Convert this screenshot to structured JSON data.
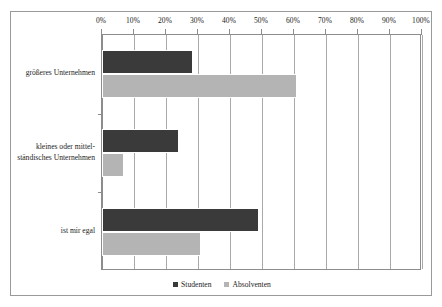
{
  "chart_data": {
    "type": "bar",
    "orientation": "horizontal",
    "title": "",
    "xlabel": "",
    "ylabel": "",
    "xlim": [
      0,
      100
    ],
    "xtick_labels": [
      "0%",
      "10%",
      "20%",
      "30%",
      "40%",
      "50%",
      "60%",
      "70%",
      "80%",
      "90%",
      "100%"
    ],
    "xtick_values": [
      0,
      10,
      20,
      30,
      40,
      50,
      60,
      70,
      80,
      90,
      100
    ],
    "grid": true,
    "axis_position": "top",
    "legend_position": "bottom",
    "categories": [
      "größeres Unternehmen",
      "kleines oder mittel-ständisches Unternehmen",
      "ist mir egal"
    ],
    "category_lines": [
      [
        "größeres Unternehmen"
      ],
      [
        "kleines oder mittel-",
        "ständisches Unternehmen"
      ],
      [
        "ist mir egal"
      ]
    ],
    "series": [
      {
        "name": "Studenten",
        "color": "#3a3a3a",
        "values": [
          28.5,
          24,
          49
        ]
      },
      {
        "name": "Absolventen",
        "color": "#b4b4b4",
        "values": [
          61,
          7,
          31
        ]
      }
    ]
  },
  "legend": {
    "entries": [
      {
        "label": "Studenten"
      },
      {
        "label": "Absolventen"
      }
    ]
  },
  "colors": {
    "studenten": "#3a3a3a",
    "absolventen": "#b4b4b4",
    "grid": "#a9a9a9",
    "frame": "#9a9a9a",
    "text": "#1c1c1c"
  }
}
